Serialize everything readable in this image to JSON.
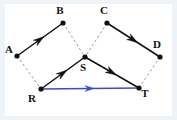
{
  "figure": {
    "background_color": "#eef3f8",
    "plot_background_color": "#ffffff",
    "solid_vector_color": "#111111",
    "dashed_line_color": "#9a9a9a",
    "resultant_vector_color": "#3b4cc0",
    "point_color": "#111111"
  },
  "points": [
    {
      "id": "A",
      "label": "A",
      "x": 17,
      "y": 56,
      "label_x": 9,
      "label_y": 53
    },
    {
      "id": "B",
      "label": "B",
      "x": 63,
      "y": 23,
      "label_x": 60,
      "label_y": 14
    },
    {
      "id": "C",
      "label": "C",
      "x": 107,
      "y": 23,
      "label_x": 104,
      "label_y": 14
    },
    {
      "id": "D",
      "label": "D",
      "x": 160,
      "y": 57,
      "label_x": 157,
      "label_y": 48
    },
    {
      "id": "S",
      "label": "S",
      "x": 85,
      "y": 57,
      "label_x": 83,
      "label_y": 71
    },
    {
      "id": "R",
      "label": "R",
      "x": 41,
      "y": 89,
      "label_x": 32,
      "label_y": 102
    },
    {
      "id": "T",
      "label": "T",
      "x": 139,
      "y": 88,
      "label_x": 145,
      "label_y": 97
    }
  ],
  "vectors": [
    {
      "id": "AB",
      "from": "A",
      "to": "B",
      "style": "solid",
      "color": "#111111",
      "arrow": "midpoint",
      "label": ""
    },
    {
      "id": "RS",
      "from": "R",
      "to": "S",
      "style": "solid",
      "color": "#111111",
      "arrow": "midpoint",
      "label": ""
    },
    {
      "id": "ST",
      "from": "S",
      "to": "T",
      "style": "solid",
      "color": "#111111",
      "arrow": "midpoint",
      "label": ""
    },
    {
      "id": "CD",
      "from": "C",
      "to": "D",
      "style": "solid",
      "color": "#111111",
      "arrow": "midpoint",
      "label": ""
    },
    {
      "id": "RT",
      "from": "R",
      "to": "T",
      "style": "solid",
      "color": "#3b4cc0",
      "arrow": "midpoint",
      "label": ""
    }
  ],
  "construction_lines": [
    {
      "id": "AR",
      "from": "A",
      "to": "R",
      "style": "dashed",
      "color": "#9a9a9a"
    },
    {
      "id": "BS",
      "from": "B",
      "to": "S",
      "style": "dashed",
      "color": "#9a9a9a"
    },
    {
      "id": "CS",
      "from": "C",
      "to": "S",
      "style": "dashed",
      "color": "#9a9a9a"
    },
    {
      "id": "DT",
      "from": "D",
      "to": "T",
      "style": "dashed",
      "color": "#9a9a9a"
    }
  ]
}
